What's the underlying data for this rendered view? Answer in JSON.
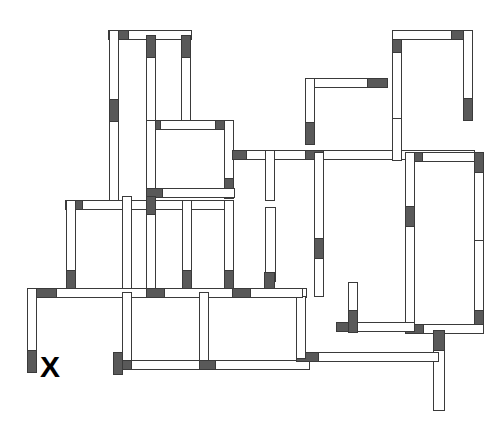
{
  "canvas": {
    "width": 504,
    "height": 434,
    "background": "#ffffff"
  },
  "style": {
    "wall_fill": "#ffffff",
    "wall_stroke": "#3a3a3a",
    "wall_cap_fill": "#595959",
    "stroke_width": 1
  },
  "diagram": {
    "type": "floor-plan",
    "marker": {
      "label": "X",
      "x": 40,
      "y": 352,
      "font_size": 30,
      "color": "#000000"
    },
    "walls": [
      {
        "id": "w01",
        "orientation": "h",
        "x": 108,
        "y": 30,
        "w": 83,
        "h": 9,
        "cap_start": 20,
        "cap_end": 0
      },
      {
        "id": "w02",
        "orientation": "v",
        "x": 109,
        "y": 30,
        "w": 9,
        "h": 75,
        "cap_start": 0,
        "cap_end": 0
      },
      {
        "id": "w03",
        "orientation": "v",
        "x": 109,
        "y": 99,
        "w": 9,
        "h": 105,
        "cap_start": 22,
        "cap_end": 0
      },
      {
        "id": "w04",
        "orientation": "v",
        "x": 146,
        "y": 35,
        "w": 9,
        "h": 88,
        "cap_start": 22,
        "cap_end": 0
      },
      {
        "id": "w05",
        "orientation": "v",
        "x": 181,
        "y": 35,
        "w": 9,
        "h": 86,
        "cap_start": 22,
        "cap_end": 0
      },
      {
        "id": "w06",
        "orientation": "h",
        "x": 146,
        "y": 120,
        "w": 87,
        "h": 9,
        "cap_start": 14,
        "cap_end": 18
      },
      {
        "id": "w07",
        "orientation": "v",
        "x": 146,
        "y": 120,
        "w": 9,
        "h": 76,
        "cap_start": 0,
        "cap_end": 0
      },
      {
        "id": "w08",
        "orientation": "v",
        "x": 224,
        "y": 120,
        "w": 9,
        "h": 78,
        "cap_start": 0,
        "cap_end": 20
      },
      {
        "id": "w09",
        "orientation": "h",
        "x": 146,
        "y": 188,
        "w": 88,
        "h": 9,
        "cap_start": 16,
        "cap_end": 0
      },
      {
        "id": "w10",
        "orientation": "h",
        "x": 232,
        "y": 150,
        "w": 80,
        "h": 9,
        "cap_start": 14,
        "cap_end": 0
      },
      {
        "id": "w11",
        "orientation": "h",
        "x": 65,
        "y": 200,
        "w": 168,
        "h": 9,
        "cap_start": 17,
        "cap_end": 0
      },
      {
        "id": "w12",
        "orientation": "v",
        "x": 66,
        "y": 200,
        "w": 9,
        "h": 92,
        "cap_start": 0,
        "cap_end": 22
      },
      {
        "id": "w13",
        "orientation": "v",
        "x": 122,
        "y": 196,
        "w": 9,
        "h": 96,
        "cap_start": 0,
        "cap_end": 0
      },
      {
        "id": "w14",
        "orientation": "v",
        "x": 146,
        "y": 196,
        "w": 9,
        "h": 96,
        "cap_start": 18,
        "cap_end": 0
      },
      {
        "id": "w15",
        "orientation": "v",
        "x": 182,
        "y": 200,
        "w": 9,
        "h": 92,
        "cap_start": 0,
        "cap_end": 22
      },
      {
        "id": "w16",
        "orientation": "v",
        "x": 224,
        "y": 200,
        "w": 9,
        "h": 92,
        "cap_start": 0,
        "cap_end": 22
      },
      {
        "id": "w17",
        "orientation": "h",
        "x": 27,
        "y": 288,
        "w": 80,
        "h": 9,
        "cap_start": 0,
        "cap_end": 0
      },
      {
        "id": "w18",
        "orientation": "v",
        "x": 27,
        "y": 288,
        "w": 9,
        "h": 84,
        "cap_start": 0,
        "cap_end": 22
      },
      {
        "id": "w19",
        "orientation": "h",
        "x": 36,
        "y": 288,
        "w": 200,
        "h": 9,
        "cap_start": 20,
        "cap_end": 0
      },
      {
        "id": "w20",
        "orientation": "h",
        "x": 146,
        "y": 288,
        "w": 160,
        "h": 9,
        "cap_start": 18,
        "cap_end": 0
      },
      {
        "id": "w21",
        "orientation": "v",
        "x": 122,
        "y": 292,
        "w": 9,
        "h": 76,
        "cap_start": 0,
        "cap_end": 0
      },
      {
        "id": "w22",
        "orientation": "v",
        "x": 199,
        "y": 292,
        "w": 9,
        "h": 76,
        "cap_start": 0,
        "cap_end": 0
      },
      {
        "id": "w23",
        "orientation": "v",
        "x": 265,
        "y": 207,
        "w": 10,
        "h": 74,
        "cap_start": 0,
        "cap_end": 0
      },
      {
        "id": "w24",
        "orientation": "v",
        "x": 264,
        "y": 272,
        "w": 10,
        "h": 24,
        "cap_start": 24,
        "cap_end": 0
      },
      {
        "id": "w25",
        "orientation": "h",
        "x": 113,
        "y": 360,
        "w": 122,
        "h": 9,
        "cap_start": 18,
        "cap_end": 18
      },
      {
        "id": "w26",
        "orientation": "h",
        "x": 199,
        "y": 360,
        "w": 110,
        "h": 9,
        "cap_start": 16,
        "cap_end": 0
      },
      {
        "id": "w27",
        "orientation": "v",
        "x": 113,
        "y": 352,
        "w": 9,
        "h": 22,
        "cap_start": 22,
        "cap_end": 0
      },
      {
        "id": "w28",
        "orientation": "h",
        "x": 305,
        "y": 78,
        "w": 82,
        "h": 9,
        "cap_start": 0,
        "cap_end": 20
      },
      {
        "id": "w29",
        "orientation": "v",
        "x": 305,
        "y": 78,
        "w": 9,
        "h": 66,
        "cap_start": 0,
        "cap_end": 22
      },
      {
        "id": "w30",
        "orientation": "h",
        "x": 305,
        "y": 150,
        "w": 110,
        "h": 9,
        "cap_start": 18,
        "cap_end": 0
      },
      {
        "id": "w31",
        "orientation": "v",
        "x": 314,
        "y": 152,
        "w": 9,
        "h": 130,
        "cap_start": 0,
        "cap_end": 0
      },
      {
        "id": "w32",
        "orientation": "v",
        "x": 314,
        "y": 238,
        "w": 9,
        "h": 58,
        "cap_start": 20,
        "cap_end": 0
      },
      {
        "id": "w33",
        "orientation": "v",
        "x": 392,
        "y": 30,
        "w": 9,
        "h": 90,
        "cap_start": 22,
        "cap_end": 0
      },
      {
        "id": "w34",
        "orientation": "h",
        "x": 392,
        "y": 30,
        "w": 80,
        "h": 9,
        "cap_start": 0,
        "cap_end": 21
      },
      {
        "id": "w35",
        "orientation": "v",
        "x": 463,
        "y": 30,
        "w": 9,
        "h": 90,
        "cap_start": 0,
        "cap_end": 22
      },
      {
        "id": "w36",
        "orientation": "h",
        "x": 392,
        "y": 150,
        "w": 82,
        "h": 9,
        "cap_start": 0,
        "cap_end": 0
      },
      {
        "id": "w37",
        "orientation": "v",
        "x": 392,
        "y": 118,
        "w": 9,
        "h": 42,
        "cap_start": 0,
        "cap_end": 0
      },
      {
        "id": "w38",
        "orientation": "h",
        "x": 405,
        "y": 152,
        "w": 78,
        "h": 9,
        "cap_start": 17,
        "cap_end": 0
      },
      {
        "id": "w39",
        "orientation": "v",
        "x": 405,
        "y": 152,
        "w": 9,
        "h": 62,
        "cap_start": 0,
        "cap_end": 0
      },
      {
        "id": "w40",
        "orientation": "v",
        "x": 405,
        "y": 206,
        "w": 9,
        "h": 126,
        "cap_start": 20,
        "cap_end": 0
      },
      {
        "id": "w41",
        "orientation": "v",
        "x": 474,
        "y": 152,
        "w": 9,
        "h": 92,
        "cap_start": 20,
        "cap_end": 0
      },
      {
        "id": "w42",
        "orientation": "v",
        "x": 474,
        "y": 240,
        "w": 9,
        "h": 92,
        "cap_start": 0,
        "cap_end": 22
      },
      {
        "id": "w43",
        "orientation": "h",
        "x": 405,
        "y": 324,
        "w": 78,
        "h": 9,
        "cap_start": 18,
        "cap_end": 0
      },
      {
        "id": "w44",
        "orientation": "h",
        "x": 336,
        "y": 322,
        "w": 78,
        "h": 9,
        "cap_start": 20,
        "cap_end": 0
      },
      {
        "id": "w45",
        "orientation": "v",
        "x": 348,
        "y": 282,
        "w": 9,
        "h": 50,
        "cap_start": 0,
        "cap_end": 22
      },
      {
        "id": "w46",
        "orientation": "v",
        "x": 433,
        "y": 330,
        "w": 11,
        "h": 80,
        "cap_start": 20,
        "cap_end": 0
      },
      {
        "id": "w47",
        "orientation": "h",
        "x": 296,
        "y": 352,
        "w": 142,
        "h": 9,
        "cap_start": 22,
        "cap_end": 0
      },
      {
        "id": "w48",
        "orientation": "v",
        "x": 296,
        "y": 296,
        "w": 9,
        "h": 62,
        "cap_start": 0,
        "cap_end": 0
      },
      {
        "id": "w49",
        "orientation": "h",
        "x": 232,
        "y": 288,
        "w": 70,
        "h": 9,
        "cap_start": 18,
        "cap_end": 0
      },
      {
        "id": "w50",
        "orientation": "v",
        "x": 265,
        "y": 150,
        "w": 9,
        "h": 50,
        "cap_start": 0,
        "cap_end": 0
      }
    ]
  }
}
